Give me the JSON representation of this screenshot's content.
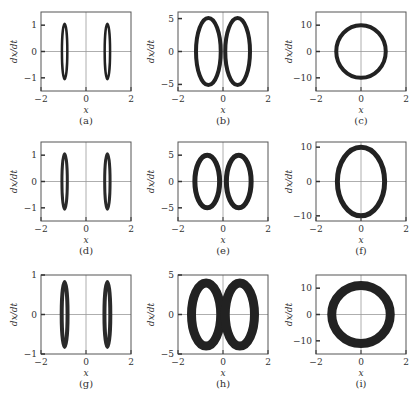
{
  "figure": {
    "panels": [
      {
        "id": "a",
        "label": "(a)",
        "ylim": [
          -1.5,
          1.5
        ],
        "yticks": [
          -1,
          0,
          1
        ],
        "ytick_labels": [
          "−1",
          "0",
          "1"
        ],
        "xticks": [
          -2,
          0,
          2
        ],
        "xtick_labels": [
          "−2",
          "0",
          "2"
        ],
        "xlabel": "x",
        "ylabel": "dx/dt",
        "shape": "two-thin",
        "rx": 0.12,
        "ry": 1.05,
        "cx": 0.95,
        "thick": 2.5,
        "fill": "#222"
      },
      {
        "id": "b",
        "label": "(b)",
        "ylim": [
          -6,
          6
        ],
        "yticks": [
          -5,
          0,
          5
        ],
        "ytick_labels": [
          "−5",
          "0",
          "5"
        ],
        "xticks": [
          -2,
          0,
          2
        ],
        "xtick_labels": [
          "−2",
          "0",
          "2"
        ],
        "xlabel": "x",
        "ylabel": "dx/dt",
        "shape": "two-loops",
        "rx": 0.55,
        "ry": 5.1,
        "cx": 0.65,
        "thick": 4,
        "fill": "#222"
      },
      {
        "id": "c",
        "label": "(c)",
        "ylim": [
          -15,
          15
        ],
        "yticks": [
          -10,
          0,
          10
        ],
        "ytick_labels": [
          "−10",
          "0",
          "10"
        ],
        "xticks": [
          -2,
          0,
          2
        ],
        "xtick_labels": [
          "−2",
          "0",
          "2"
        ],
        "xlabel": "x",
        "ylabel": "dx/dt",
        "shape": "one-loop",
        "rx": 1.1,
        "ry": 10,
        "cx": 0,
        "thick": 4,
        "fill": "#222"
      },
      {
        "id": "d",
        "label": "(d)",
        "ylim": [
          -1.5,
          1.5
        ],
        "yticks": [
          -1,
          0,
          1
        ],
        "ytick_labels": [
          "−1",
          "0",
          "1"
        ],
        "xticks": [
          -2,
          0,
          2
        ],
        "xtick_labels": [
          "−2",
          "0",
          "2"
        ],
        "xlabel": "x",
        "ylabel": "dx/dt",
        "shape": "two-thin",
        "rx": 0.12,
        "ry": 1.05,
        "cx": 0.95,
        "thick": 3,
        "fill": "#2a2a2a"
      },
      {
        "id": "e",
        "label": "(e)",
        "ylim": [
          -7.5,
          7.5
        ],
        "yticks": [
          -5,
          0,
          5
        ],
        "ytick_labels": [
          "−5",
          "0",
          "5"
        ],
        "xticks": [
          -2,
          0,
          2
        ],
        "xtick_labels": [
          "−2",
          "0",
          "2"
        ],
        "xlabel": "x",
        "ylabel": "dx/dt",
        "shape": "two-loops",
        "rx": 0.55,
        "ry": 5,
        "cx": 0.7,
        "thick": 5,
        "fill": "#222"
      },
      {
        "id": "f",
        "label": "(f)",
        "ylim": [
          -11.5,
          11.5
        ],
        "yticks": [
          -10,
          0,
          10
        ],
        "ytick_labels": [
          "−10",
          "0",
          "10"
        ],
        "xticks": [
          -2,
          0,
          2
        ],
        "xtick_labels": [
          "−2",
          "0",
          "2"
        ],
        "xlabel": "x",
        "ylabel": "dx/dt",
        "shape": "one-loop",
        "rx": 1.05,
        "ry": 10,
        "cx": 0,
        "thick": 5,
        "fill": "#222"
      },
      {
        "id": "g",
        "label": "(g)",
        "ylim": [
          -1,
          1
        ],
        "yticks": [
          -1,
          0,
          1
        ],
        "ytick_labels": [
          "−1",
          "0",
          "1"
        ],
        "xticks": [
          -2,
          0,
          2
        ],
        "xtick_labels": [
          "−2",
          "0",
          "2"
        ],
        "xlabel": "x",
        "ylabel": "dx/dt",
        "shape": "two-thin",
        "rx": 0.13,
        "ry": 0.82,
        "cx": 0.95,
        "thick": 4,
        "fill": "#2a2a2a"
      },
      {
        "id": "h",
        "label": "(h)",
        "ylim": [
          -5,
          5
        ],
        "yticks": [
          -5,
          0,
          5
        ],
        "ytick_labels": [
          "−5",
          "0",
          "5"
        ],
        "xticks": [
          -2,
          0,
          2
        ],
        "xtick_labels": [
          "−2",
          "0",
          "2"
        ],
        "xlabel": "x",
        "ylabel": "dx/dt",
        "shape": "two-loops",
        "rx": 0.65,
        "ry": 4,
        "cx": 0.75,
        "thick": 9,
        "fill": "#222"
      },
      {
        "id": "i",
        "label": "(i)",
        "ylim": [
          -15,
          15
        ],
        "yticks": [
          -10,
          0,
          10
        ],
        "ytick_labels": [
          "−10",
          "0",
          "10"
        ],
        "xticks": [
          -2,
          0,
          2
        ],
        "xtick_labels": [
          "−2",
          "0",
          "2"
        ],
        "xlabel": "x",
        "ylabel": "dx/dt",
        "shape": "one-loop",
        "rx": 1.3,
        "ry": 11,
        "cx": 0,
        "thick": 9,
        "fill": "#222"
      }
    ]
  },
  "chart_data": [
    {
      "type": "scatter",
      "panel": "(a)",
      "title": "",
      "xlabel": "x",
      "ylabel": "dx/dt",
      "xlim": [
        -2,
        2
      ],
      "ylim": [
        -1.5,
        1.5
      ],
      "xticks": [
        -2,
        0,
        2
      ],
      "yticks": [
        -1,
        0,
        1
      ],
      "description": "Two narrow closed orbits centered at x≈±0.95, dx/dt range ≈[-1.05,1.05]"
    },
    {
      "type": "scatter",
      "panel": "(b)",
      "title": "",
      "xlabel": "x",
      "ylabel": "dx/dt",
      "xlim": [
        -2,
        2
      ],
      "ylim": [
        -6,
        6
      ],
      "xticks": [
        -2,
        0,
        2
      ],
      "yticks": [
        -5,
        0,
        5
      ],
      "description": "Two elliptical orbits centered at x≈±0.65, x span ≈[-1.2,1.2], dx/dt range ≈[-5.1,5.1]"
    },
    {
      "type": "scatter",
      "panel": "(c)",
      "title": "",
      "xlabel": "x",
      "ylabel": "dx/dt",
      "xlim": [
        -2,
        2
      ],
      "ylim": [
        -15,
        15
      ],
      "xticks": [
        -2,
        0,
        2
      ],
      "yticks": [
        -10,
        0,
        10
      ],
      "description": "Single large orbit centered at origin, x span ≈[-1.1,1.1], dx/dt range ≈[-10,10]"
    },
    {
      "type": "scatter",
      "panel": "(d)",
      "title": "",
      "xlabel": "x",
      "ylabel": "dx/dt",
      "xlim": [
        -2,
        2
      ],
      "ylim": [
        -1.5,
        1.5
      ],
      "xticks": [
        -2,
        0,
        2
      ],
      "yticks": [
        -1,
        0,
        1
      ],
      "description": "Two narrow orbits at x≈±0.95, dx/dt range ≈[-1.05,1.05]"
    },
    {
      "type": "scatter",
      "panel": "(e)",
      "title": "",
      "xlabel": "x",
      "ylabel": "dx/dt",
      "xlim": [
        -2,
        2
      ],
      "ylim": [
        -7.5,
        7.5
      ],
      "xticks": [
        -2,
        0,
        2
      ],
      "yticks": [
        -5,
        0,
        5
      ],
      "description": "Two elliptical orbits centered at x≈±0.7, dx/dt range ≈[-5,5]"
    },
    {
      "type": "scatter",
      "panel": "(f)",
      "title": "",
      "xlabel": "x",
      "ylabel": "dx/dt",
      "xlim": [
        -2,
        2
      ],
      "ylim": [
        -11.5,
        11.5
      ],
      "xticks": [
        -2,
        0,
        2
      ],
      "yticks": [
        -10,
        0,
        10
      ],
      "description": "Single orbit centered at origin, x span ≈[-1.05,1.05], dx/dt range ≈[-10,10]"
    },
    {
      "type": "scatter",
      "panel": "(g)",
      "title": "",
      "xlabel": "x",
      "ylabel": "dx/dt",
      "xlim": [
        -2,
        2
      ],
      "ylim": [
        -1,
        1
      ],
      "xticks": [
        -2,
        0,
        2
      ],
      "yticks": [
        -1,
        0,
        1
      ],
      "description": "Two narrow thick bands at x≈±0.95, dx/dt range ≈[-0.82,0.82]"
    },
    {
      "type": "scatter",
      "panel": "(h)",
      "title": "",
      "xlabel": "x",
      "ylabel": "dx/dt",
      "xlim": [
        -2,
        2
      ],
      "ylim": [
        -5,
        5
      ],
      "xticks": [
        -2,
        0,
        2
      ],
      "yticks": [
        -5,
        0,
        5
      ],
      "description": "Two thick elliptical bands centered at x≈±0.75, dx/dt range ≈[-4,4]"
    },
    {
      "type": "scatter",
      "panel": "(i)",
      "title": "",
      "xlabel": "x",
      "ylabel": "dx/dt",
      "xlim": [
        -2,
        2
      ],
      "ylim": [
        -15,
        15
      ],
      "xticks": [
        -2,
        0,
        2
      ],
      "yticks": [
        -10,
        0,
        10
      ],
      "description": "Single thick orbit centered at origin, x span ≈[-1.3,1.3], dx/dt range ≈[-11,11]"
    }
  ]
}
